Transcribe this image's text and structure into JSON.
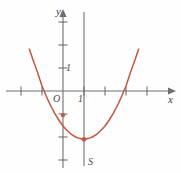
{
  "figure": {
    "background_color": "#fefefe",
    "curve_color": "#c4553f",
    "axis_color": "#6e6e6e",
    "text_color": "#3f3f3f",
    "width": 181,
    "height": 173
  },
  "labels": {
    "y_axis": "y",
    "x_axis": "x",
    "origin": "O",
    "x_one": "1",
    "y_one": "1",
    "vertex": "S"
  },
  "chart_data": {
    "type": "line",
    "title": "",
    "subtitle": "",
    "xlabel": "x",
    "ylabel": "y",
    "grid": false,
    "legend_position": "none",
    "xlim": [
      -2.5,
      5.2
    ],
    "ylim": [
      -2.8,
      3.5
    ],
    "x_ticks": [
      -2,
      -1,
      0,
      1,
      2,
      3,
      4,
      5
    ],
    "x_tick_labels": [
      "",
      "",
      "O",
      "1",
      "",
      "",
      "",
      ""
    ],
    "y_ticks": [
      -2,
      -1,
      0,
      1,
      2,
      3
    ],
    "y_tick_labels": [
      "",
      "",
      "",
      "1",
      "",
      ""
    ],
    "axis_of_symmetry": 1,
    "vertex": {
      "x": 1,
      "y": -2.1,
      "label": "S"
    },
    "y_intercept": {
      "x": 0,
      "y": -1.05
    },
    "x_intercepts": [
      -0.9,
      2.9
    ],
    "equation": "y = 0.58*(x - 1)^2 - 2.1",
    "series": [
      {
        "name": "parabola",
        "color": "#c4553f",
        "x": [
          -1.6,
          -1.4,
          -1.2,
          -1.0,
          -0.8,
          -0.6,
          -0.4,
          -0.2,
          0.0,
          0.2,
          0.4,
          0.6,
          0.8,
          1.0,
          1.2,
          1.4,
          1.6,
          1.8,
          2.0,
          2.2,
          2.4,
          2.6,
          2.8,
          3.0,
          3.2,
          3.4,
          3.6
        ],
        "y": [
          1.82,
          1.28,
          0.77,
          0.22,
          -0.22,
          -0.62,
          -0.96,
          -1.26,
          -1.52,
          -1.72,
          -1.89,
          -2.0,
          -2.07,
          -2.1,
          -2.07,
          -2.0,
          -1.89,
          -1.72,
          -1.52,
          -1.26,
          -0.96,
          -0.62,
          -0.22,
          0.22,
          0.77,
          1.28,
          1.82
        ]
      }
    ],
    "markers": [
      {
        "x": 0,
        "y": -1.05,
        "name": "y-intercept-dot"
      },
      {
        "x": 1,
        "y": -2.1,
        "name": "vertex-dot"
      }
    ]
  }
}
